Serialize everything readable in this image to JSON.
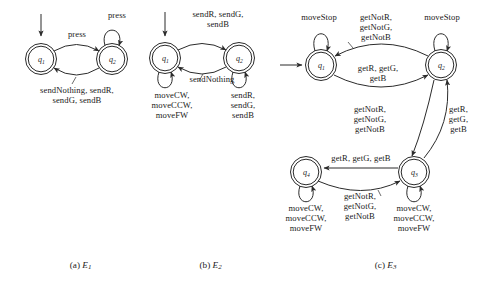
{
  "figure": {
    "background": "#ffffff",
    "stroke": "#2b2b2b",
    "subfigures": [
      {
        "id": "E1",
        "caption_prefix": "(a) ",
        "caption_symbol": "E",
        "caption_subscript": "1",
        "states": [
          {
            "name": "q",
            "subscript": "1",
            "accepting": true,
            "initial": true
          },
          {
            "name": "q",
            "subscript": "2",
            "accepting": true,
            "initial": false
          }
        ],
        "transitions": [
          {
            "from": "q1",
            "to": "q2",
            "label": "press"
          },
          {
            "from": "q2",
            "to": "q2",
            "label": "press",
            "self": true
          },
          {
            "from": "q2",
            "to": "q1",
            "label": "sendNothing, sendR,\nsendG, sendB"
          }
        ]
      },
      {
        "id": "E2",
        "caption_prefix": "(b) ",
        "caption_symbol": "E",
        "caption_subscript": "2",
        "states": [
          {
            "name": "q",
            "subscript": "1",
            "accepting": true,
            "initial": true
          },
          {
            "name": "q",
            "subscript": "2",
            "accepting": true,
            "initial": false
          }
        ],
        "transitions": [
          {
            "from": "q1",
            "to": "q2",
            "label": "sendR, sendG,\nsendB"
          },
          {
            "from": "q2",
            "to": "q1",
            "label": "sendNothing"
          },
          {
            "from": "q1",
            "to": "q1",
            "label": "moveCW,\nmoveCCW,\nmoveFW",
            "self": true
          },
          {
            "from": "q2",
            "to": "q2",
            "label": "sendR,\nsendG,\nsendB",
            "self": true
          }
        ]
      },
      {
        "id": "E3",
        "caption_prefix": "(c) ",
        "caption_symbol": "E",
        "caption_subscript": "3",
        "states": [
          {
            "name": "q",
            "subscript": "1",
            "accepting": true,
            "initial": true
          },
          {
            "name": "q",
            "subscript": "2",
            "accepting": true,
            "initial": false
          },
          {
            "name": "q",
            "subscript": "3",
            "accepting": true,
            "initial": false
          },
          {
            "name": "q",
            "subscript": "4",
            "accepting": true,
            "initial": false
          }
        ],
        "transitions": [
          {
            "from": "q1",
            "to": "q1",
            "label": "moveStop",
            "self": true
          },
          {
            "from": "q2",
            "to": "q2",
            "label": "moveStop",
            "self": true
          },
          {
            "from": "q2",
            "to": "q1",
            "label": "getNotR,\ngetNotG,\ngetNotB"
          },
          {
            "from": "q1",
            "to": "q2",
            "label": "getR, getG,\ngetB"
          },
          {
            "from": "q2",
            "to": "q3",
            "label": "getNotR,\ngetNotG,\ngetNotB"
          },
          {
            "from": "q3",
            "to": "q2",
            "label": "getR,\ngetG,\ngetB"
          },
          {
            "from": "q3",
            "to": "q4",
            "label": "getR, getG, getB"
          },
          {
            "from": "q4",
            "to": "q3",
            "label": "getNotR,\ngetNotG,\ngetNotB"
          },
          {
            "from": "q4",
            "to": "q4",
            "label": "moveCW,\nmoveCCW,\nmoveFW",
            "self": true
          },
          {
            "from": "q3",
            "to": "q3",
            "label": "moveCW,\nmoveCCW,\nmoveFW",
            "self": true
          }
        ]
      }
    ]
  },
  "labels": {
    "a_press_top": "press",
    "a_press_mid": "press",
    "a_send_multi": "sendNothing, sendR,\nsendG, sendB",
    "b_send_rgb": "sendR, sendG,\nsendB",
    "b_sendnothing": "sendNothing",
    "b_move_left": "moveCW,\nmoveCCW,\nmoveFW",
    "b_send_right": "sendR,\nsendG,\nsendB",
    "c_movestop_left": "moveStop",
    "c_movestop_right": "moveStop",
    "c_getnot_top": "getNotR,\ngetNotG,\ngetNotB",
    "c_get_mid": "getR, getG,\ngetB",
    "c_getnot_vert": "getNotR,\ngetNotG,\ngetNotB",
    "c_get_vert": "getR,\ngetG,\ngetB",
    "c_get_bottom": "getR, getG, getB",
    "c_getnot_bottom": "getNotR,\ngetNotG,\ngetNotB",
    "c_move_left": "moveCW,\nmoveCCW,\nmoveFW",
    "c_move_right": "moveCW,\nmoveCCW,\nmoveFW"
  },
  "captions": {
    "a": "(a) ",
    "a_sym": "E",
    "a_sub": "1",
    "b": "(b) ",
    "b_sym": "E",
    "b_sub": "2",
    "c": "(c) ",
    "c_sym": "E",
    "c_sub": "3"
  }
}
